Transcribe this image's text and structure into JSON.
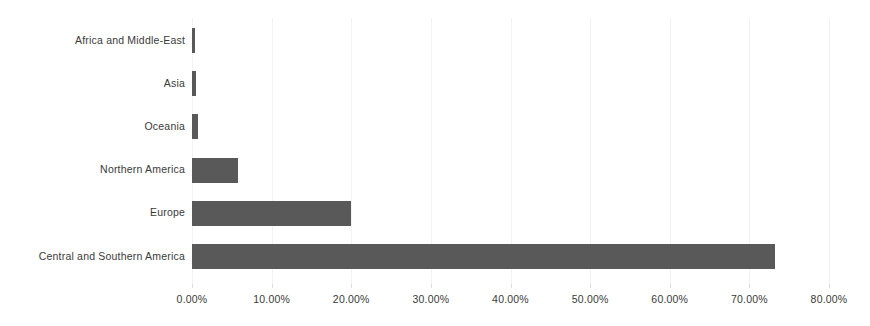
{
  "chart_data": {
    "type": "bar",
    "orientation": "horizontal",
    "title": "",
    "subtitle": "",
    "xlabel": "",
    "ylabel": "",
    "categories": [
      "Africa and Middle-East",
      "Asia",
      "Oceania",
      "Northern America",
      "Europe",
      "Central and Southern America"
    ],
    "values": [
      0.4,
      0.5,
      0.8,
      5.8,
      20.0,
      73.2
    ],
    "value_format": "percent",
    "xlim": [
      0,
      80
    ],
    "xticks": [
      0,
      10,
      20,
      30,
      40,
      50,
      60,
      70,
      80
    ],
    "xtick_labels": [
      "0.00%",
      "10.00%",
      "20.00%",
      "30.00%",
      "40.00%",
      "50.00%",
      "60.00%",
      "70.00%",
      "80.00%"
    ],
    "grid": true,
    "legend": false,
    "bar_color": "#595959",
    "background_color": "#ffffff",
    "text_color": "#3a3a3a"
  }
}
